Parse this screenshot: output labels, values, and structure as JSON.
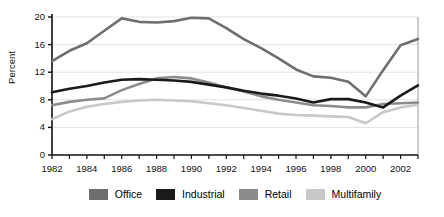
{
  "chart_data": {
    "type": "line",
    "title": "",
    "xlabel": "",
    "ylabel": "Percent",
    "ylim": [
      0,
      20
    ],
    "yticks": [
      0,
      4,
      8,
      12,
      16,
      20
    ],
    "xlim": [
      1982,
      2003
    ],
    "x": [
      1982,
      1983,
      1984,
      1985,
      1986,
      1987,
      1988,
      1989,
      1990,
      1991,
      1992,
      1993,
      1994,
      1995,
      1996,
      1997,
      1998,
      1999,
      2000,
      2001,
      2002,
      2003
    ],
    "xticks": [
      1982,
      1983,
      1984,
      1985,
      1986,
      1987,
      1988,
      1989,
      1990,
      1991,
      1992,
      1993,
      1994,
      1995,
      1996,
      1997,
      1998,
      1999,
      2000,
      2001,
      2002,
      2003
    ],
    "xtick_labels": [
      "1982",
      "",
      "1984",
      "",
      "1986",
      "",
      "1988",
      "",
      "1990",
      "",
      "1992",
      "",
      "1994",
      "",
      "1996",
      "",
      "1998",
      "",
      "2000",
      "",
      "2002",
      ""
    ],
    "grid": "horizontal",
    "legend_position": "bottom",
    "series": [
      {
        "name": "Office",
        "color": "#6e6e6e",
        "values": [
          13.6,
          15.1,
          16.2,
          18.0,
          19.8,
          19.3,
          19.2,
          19.4,
          19.9,
          19.8,
          18.4,
          16.8,
          15.5,
          14.0,
          12.4,
          11.4,
          11.2,
          10.6,
          8.5,
          12.3,
          15.9,
          16.8
        ]
      },
      {
        "name": "Industrial",
        "color": "#1a1a1a",
        "values": [
          9.1,
          9.6,
          10.0,
          10.5,
          10.9,
          11.0,
          10.9,
          10.8,
          10.6,
          10.2,
          9.8,
          9.3,
          8.9,
          8.6,
          8.2,
          7.6,
          8.1,
          8.1,
          7.6,
          6.9,
          8.6,
          10.1
        ]
      },
      {
        "name": "Retail",
        "color": "#8c8c8c",
        "values": [
          7.2,
          7.7,
          8.0,
          8.2,
          9.4,
          10.3,
          11.1,
          11.3,
          11.1,
          10.5,
          9.8,
          9.2,
          8.5,
          8.0,
          7.6,
          7.2,
          7.1,
          6.9,
          6.9,
          7.4,
          7.5,
          7.6
        ]
      },
      {
        "name": "Multifamily",
        "color": "#c8c8c8",
        "values": [
          5.2,
          6.3,
          7.0,
          7.4,
          7.7,
          7.9,
          8.0,
          7.9,
          7.8,
          7.5,
          7.2,
          6.8,
          6.4,
          6.0,
          5.8,
          5.7,
          5.6,
          5.5,
          4.6,
          6.2,
          6.9,
          7.3
        ]
      }
    ]
  },
  "legend": {
    "items": [
      {
        "label": "Office"
      },
      {
        "label": "Industrial"
      },
      {
        "label": "Retail"
      },
      {
        "label": "Multifamily"
      }
    ]
  }
}
